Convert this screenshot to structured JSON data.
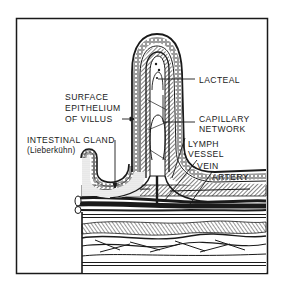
{
  "figure": {
    "labels": {
      "surface_epithelium": [
        "SURFACE",
        "EPITHELIUM",
        "OF VILLUS"
      ],
      "intestinal_gland": "INTESTINAL GLAND",
      "intestinal_gland_sub": "(Lieberkühn)",
      "lacteal": "LACTEAL",
      "capillary_network": [
        "CAPILLARY",
        "NETWORK"
      ],
      "lymph_vessel": [
        "LYMPH",
        "VESSEL"
      ],
      "vein": "VEIN",
      "artery": "ARTERY"
    },
    "colors": {
      "ink": "#1a1a1a",
      "paper": "#ffffff"
    }
  }
}
